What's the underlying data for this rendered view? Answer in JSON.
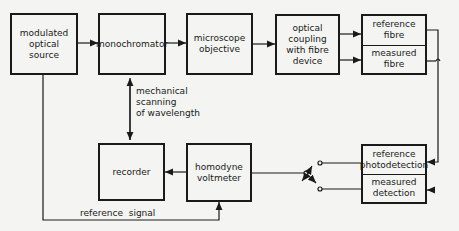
{
  "blocks": {
    "source": "modulated\noptical\nsource",
    "monochromator": "monochromator",
    "objective": "microscope\nobjective",
    "coupling": "optical\ncoupling\nwith fibre\ndevice",
    "fibre_ref": "reference\nfibre",
    "fibre_meas": "measured\nfibre",
    "recorder": "recorder",
    "voltmeter": "homodyne\nvoltmeter",
    "det_ref": "reference\nphotodetection",
    "det_meas": "measured\ndetection"
  },
  "annotations": {
    "scanning": "mechanical\nscanning\nof wavelength",
    "ref_signal": "reference  signal"
  }
}
